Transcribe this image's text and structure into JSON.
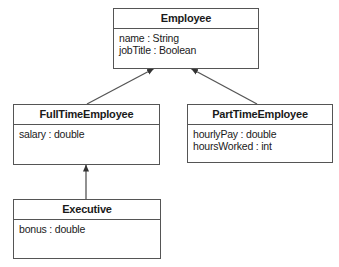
{
  "diagram": {
    "type": "uml-class-diagram",
    "classes": [
      {
        "id": "employee",
        "name": "Employee",
        "attributes": [
          "name : String",
          "jobTitle : Boolean"
        ]
      },
      {
        "id": "fulltime",
        "name": "FullTimeEmployee",
        "attributes": [
          "salary : double"
        ]
      },
      {
        "id": "parttime",
        "name": "PartTimeEmployee",
        "attributes": [
          "hourlyPay : double",
          "hoursWorked : int"
        ]
      },
      {
        "id": "executive",
        "name": "Executive",
        "attributes": [
          "bonus : double"
        ]
      }
    ],
    "relationships": [
      {
        "from": "FullTimeEmployee",
        "to": "Employee",
        "kind": "generalization"
      },
      {
        "from": "PartTimeEmployee",
        "to": "Employee",
        "kind": "generalization"
      },
      {
        "from": "Executive",
        "to": "FullTimeEmployee",
        "kind": "generalization"
      }
    ],
    "colors": {
      "line": "#555555",
      "text": "#1a1a1a",
      "background": "#ffffff"
    }
  }
}
